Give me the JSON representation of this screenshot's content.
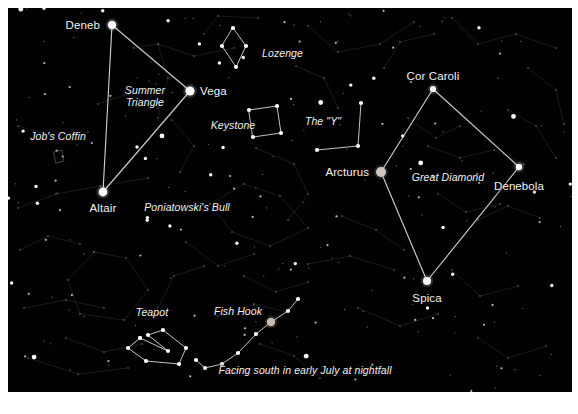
{
  "figure": {
    "kind": "star-chart",
    "background_color": "#010101",
    "page_color": "#ffffff",
    "star_color": "#ffffff",
    "line_color": "#d8d8d8",
    "faint_line_color": "#4a4440",
    "label_color": "#f2f2f2",
    "caption": "Facing south in early July at nightfall"
  },
  "star_labels": [
    {
      "id": "deneb",
      "text": "Deneb",
      "x": 100,
      "y": 25,
      "anchor": "right"
    },
    {
      "id": "vega",
      "text": "Vega",
      "x": 200,
      "y": 91,
      "anchor": "left"
    },
    {
      "id": "altair",
      "text": "Altair",
      "x": 103,
      "y": 208,
      "anchor": "mid"
    },
    {
      "id": "cor-caroli",
      "text": "Cor Caroli",
      "x": 433,
      "y": 76,
      "anchor": "mid"
    },
    {
      "id": "arcturus",
      "text": "Arcturus",
      "x": 369,
      "y": 172,
      "anchor": "right"
    },
    {
      "id": "denebola",
      "text": "Denebola",
      "x": 519,
      "y": 186,
      "anchor": "mid"
    },
    {
      "id": "spica",
      "text": "Spica",
      "x": 427,
      "y": 298,
      "anchor": "mid"
    }
  ],
  "asterism_labels": [
    {
      "id": "summer-triangle",
      "text": "Summer\nTriangle",
      "x": 145,
      "y": 96,
      "anchor": "mid"
    },
    {
      "id": "lozenge",
      "text": "Lozenge",
      "x": 262,
      "y": 54,
      "anchor": "left"
    },
    {
      "id": "keystone",
      "text": "Keystone",
      "x": 233,
      "y": 126,
      "anchor": "mid"
    },
    {
      "id": "jobs-coffin",
      "text": "Job's Coffin",
      "x": 58,
      "y": 137,
      "anchor": "mid"
    },
    {
      "id": "poniatowskis-bull",
      "text": "Poniatowski's Bull",
      "x": 187,
      "y": 208,
      "anchor": "mid"
    },
    {
      "id": "the-y",
      "text": "The \"Y\"",
      "x": 323,
      "y": 122,
      "anchor": "mid"
    },
    {
      "id": "great-diamond",
      "text": "Great Diamond",
      "x": 448,
      "y": 178,
      "anchor": "mid"
    },
    {
      "id": "teapot",
      "text": "Teapot",
      "x": 152,
      "y": 313,
      "anchor": "mid"
    },
    {
      "id": "fish-hook",
      "text": "Fish Hook",
      "x": 238,
      "y": 312,
      "anchor": "mid"
    }
  ],
  "caption_label": {
    "id": "caption",
    "text": "Facing south in early July at nightfall",
    "x": 305,
    "y": 371,
    "anchor": "mid"
  },
  "chart_data": {
    "type": "scatter",
    "xlabel": "",
    "ylabel": "",
    "xlim": [
      0,
      578
    ],
    "ylim": [
      0,
      414
    ],
    "grid": false,
    "legend": "none",
    "named_stars": [
      {
        "name": "Deneb",
        "x": 112,
        "y": 25,
        "r": 4.2,
        "color": "#ffffff"
      },
      {
        "name": "Vega",
        "x": 190,
        "y": 91,
        "r": 4.6,
        "color": "#ffffff"
      },
      {
        "name": "Altair",
        "x": 103,
        "y": 192,
        "r": 4.4,
        "color": "#ffffff"
      },
      {
        "name": "Cor Caroli",
        "x": 433,
        "y": 89,
        "r": 3.0,
        "color": "#ffffff"
      },
      {
        "name": "Arcturus",
        "x": 381,
        "y": 172,
        "r": 5.0,
        "color": "#cfc8bf"
      },
      {
        "name": "Denebola",
        "x": 519,
        "y": 167,
        "r": 3.2,
        "color": "#ffffff"
      },
      {
        "name": "Spica",
        "x": 427,
        "y": 281,
        "r": 4.0,
        "color": "#ffffff"
      },
      {
        "name": "Antares",
        "x": 271,
        "y": 322,
        "r": 4.2,
        "color": "#c8bcae"
      }
    ],
    "asterism_polylines": [
      {
        "name": "Summer Triangle",
        "closed": true,
        "points": [
          [
            112,
            25
          ],
          [
            190,
            91
          ],
          [
            103,
            192
          ]
        ]
      },
      {
        "name": "Great Diamond",
        "closed": true,
        "points": [
          [
            433,
            89
          ],
          [
            519,
            167
          ],
          [
            427,
            281
          ],
          [
            381,
            172
          ]
        ]
      },
      {
        "name": "Lozenge",
        "closed": true,
        "points": [
          [
            233,
            28
          ],
          [
            246,
            46
          ],
          [
            236,
            67
          ],
          [
            222,
            46
          ]
        ]
      },
      {
        "name": "Keystone",
        "closed": true,
        "points": [
          [
            249,
            110
          ],
          [
            277,
            106
          ],
          [
            281,
            133
          ],
          [
            253,
            137
          ]
        ]
      },
      {
        "name": "The Y",
        "closed": false,
        "points": [
          [
            361,
            103
          ],
          [
            358,
            146
          ],
          [
            317,
            150
          ]
        ]
      },
      {
        "name": "Teapot",
        "closed": false,
        "points": [
          [
            140,
            338
          ],
          [
            128,
            348
          ],
          [
            146,
            361
          ],
          [
            179,
            364
          ],
          [
            186,
            348
          ],
          [
            163,
            330
          ],
          [
            148,
            335
          ],
          [
            168,
            351
          ],
          [
            140,
            338
          ]
        ]
      },
      {
        "name": "Fish Hook",
        "closed": false,
        "points": [
          [
            298,
            299
          ],
          [
            288,
            311
          ],
          [
            271,
            322
          ],
          [
            256,
            334
          ],
          [
            238,
            353
          ],
          [
            222,
            364
          ],
          [
            205,
            368
          ],
          [
            196,
            360
          ]
        ]
      },
      {
        "name": "Job's Coffin",
        "closed": true,
        "points": [
          [
            54,
            152
          ],
          [
            62,
            150
          ],
          [
            64,
            161
          ],
          [
            56,
            163
          ]
        ]
      }
    ],
    "background_stars_count": 210,
    "faint_constellation_lines_count": 34
  }
}
